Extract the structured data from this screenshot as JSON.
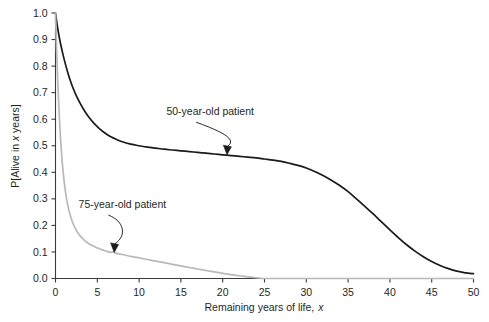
{
  "chart_data": {
    "type": "line",
    "title": "",
    "xlabel": "Remaining years of life, x",
    "ylabel": "P[Alive in x years]",
    "xlim": [
      0,
      50
    ],
    "ylim": [
      0,
      1.0
    ],
    "grid": false,
    "legend_position": "inline-annotations",
    "xticks": [
      0,
      5,
      10,
      15,
      20,
      25,
      30,
      35,
      40,
      45,
      50
    ],
    "xtick_labels": [
      "0",
      "5",
      "10",
      "15",
      "20",
      "25",
      "30",
      "35",
      "40",
      "45",
      "50"
    ],
    "yticks": [
      0.0,
      0.1,
      0.2,
      0.3,
      0.4,
      0.5,
      0.6,
      0.7,
      0.8,
      0.9,
      1.0
    ],
    "ytick_labels": [
      "0.0",
      "0.1",
      "0.2",
      "0.3",
      "0.4",
      "0.5",
      "0.6",
      "0.7",
      "0.8",
      "0.9",
      "1.0"
    ],
    "annotations": [
      {
        "text": "50-year-old patient",
        "label_x": 18.5,
        "label_y": 0.615,
        "points_to_x": 20.4,
        "points_to_y": 0.468,
        "color": "#1a1a1a"
      },
      {
        "text": "75-year-old patient",
        "label_x": 8.0,
        "label_y": 0.265,
        "points_to_x": 6.9,
        "points_to_y": 0.1,
        "color": "#1a1a1a"
      }
    ],
    "series": [
      {
        "name": "50-year-old patient",
        "color": "#1a1a1a",
        "width": 1.7,
        "x": [
          0,
          0.3,
          0.6,
          1,
          1.5,
          2,
          2.5,
          3,
          3.5,
          4,
          4.5,
          5,
          5.5,
          6,
          6.5,
          7,
          7.5,
          8,
          9,
          10,
          11,
          12,
          13,
          14,
          15,
          16,
          17,
          18,
          19,
          20,
          21,
          22,
          23,
          24,
          25,
          26,
          27,
          28,
          29,
          30,
          31,
          32,
          33,
          34,
          35,
          36,
          37,
          38,
          39,
          40,
          41,
          42,
          43,
          44,
          45,
          46,
          47,
          48,
          49,
          50
        ],
        "y": [
          1.0,
          0.935,
          0.885,
          0.83,
          0.772,
          0.725,
          0.688,
          0.657,
          0.63,
          0.607,
          0.588,
          0.572,
          0.558,
          0.546,
          0.536,
          0.528,
          0.521,
          0.515,
          0.506,
          0.5,
          0.495,
          0.491,
          0.487,
          0.484,
          0.481,
          0.478,
          0.475,
          0.472,
          0.469,
          0.466,
          0.463,
          0.46,
          0.457,
          0.454,
          0.45,
          0.446,
          0.441,
          0.434,
          0.426,
          0.416,
          0.403,
          0.388,
          0.37,
          0.35,
          0.327,
          0.3,
          0.272,
          0.243,
          0.213,
          0.183,
          0.154,
          0.127,
          0.103,
          0.082,
          0.064,
          0.049,
          0.037,
          0.028,
          0.021,
          0.018
        ]
      },
      {
        "name": "75-year-old patient",
        "color": "#b9b9b9",
        "width": 1.7,
        "x": [
          0,
          0.15,
          0.3,
          0.5,
          0.75,
          1,
          1.3,
          1.6,
          2,
          2.4,
          2.8,
          3.2,
          3.6,
          4,
          4.4,
          4.8,
          5.2,
          5.6,
          6,
          6.3,
          6.6,
          6.9,
          7.2,
          7.6,
          8,
          9,
          10,
          11,
          12,
          13,
          14,
          15,
          16,
          17,
          18,
          19,
          20,
          21,
          22,
          23,
          24,
          24.6,
          25,
          30,
          35,
          40,
          45,
          50
        ],
        "y": [
          1.0,
          0.845,
          0.72,
          0.585,
          0.46,
          0.375,
          0.305,
          0.258,
          0.215,
          0.187,
          0.167,
          0.152,
          0.14,
          0.131,
          0.124,
          0.118,
          0.113,
          0.108,
          0.104,
          0.1005,
          0.0985,
          0.1,
          0.0955,
          0.0925,
          0.0905,
          0.0835,
          0.0775,
          0.0715,
          0.0655,
          0.0595,
          0.0535,
          0.0475,
          0.0415,
          0.0358,
          0.0302,
          0.0248,
          0.0196,
          0.0148,
          0.0104,
          0.0064,
          0.0028,
          0.001,
          0.0,
          0.0,
          0.0,
          0.0,
          0.0,
          0.0
        ]
      }
    ]
  },
  "axes": {
    "x_title": "Remaining years of life, x",
    "x_title_plain": "Remaining years of life,",
    "x_title_italic": "x",
    "y_title_prefix": "P[Alive in ",
    "y_title_italic": "x",
    "y_title_suffix": " years]"
  }
}
